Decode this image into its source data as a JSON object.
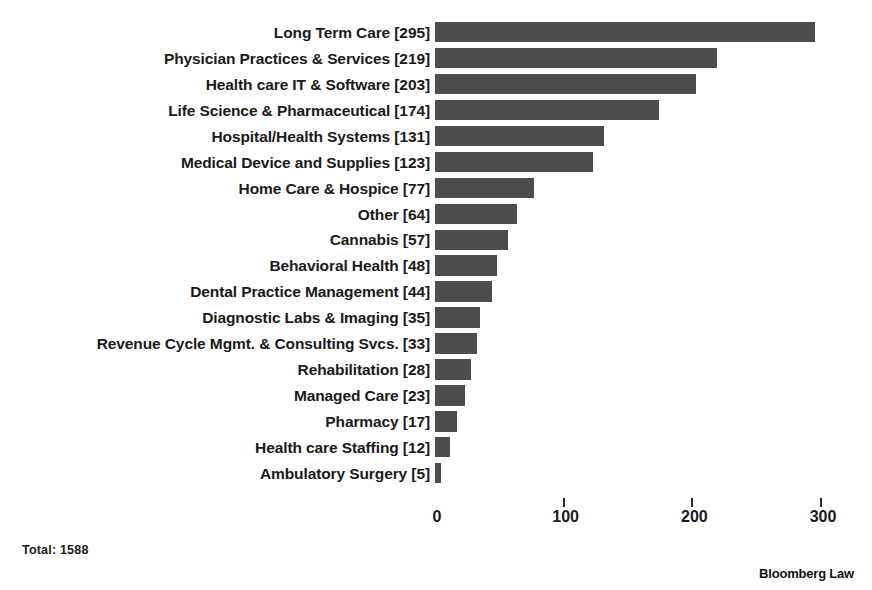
{
  "chart_data": {
    "type": "bar",
    "orientation": "horizontal",
    "title": "",
    "subtitle": "",
    "xlabel": "",
    "ylabel": "",
    "xlim": [
      0,
      320
    ],
    "xticks": [
      0,
      100,
      200,
      300
    ],
    "xtick_labels": [
      "0",
      "100",
      "200",
      "300"
    ],
    "tick_marks_shown_at": [
      100,
      200,
      300
    ],
    "grid": false,
    "legend": null,
    "bar_color": "#4d4d4d",
    "background_color": "#ffffff",
    "categories": [
      "Long Term Care",
      "Physician Practices & Services",
      "Health care IT & Software",
      "Life Science & Pharmaceutical",
      "Hospital/Health Systems",
      "Medical Device and Supplies",
      "Home Care & Hospice",
      "Other",
      "Cannabis",
      "Behavioral Health",
      "Dental Practice Management",
      "Diagnostic Labs & Imaging",
      "Revenue Cycle Mgmt. & Consulting Svcs.",
      "Rehabilitation",
      "Managed Care",
      "Pharmacy",
      "Health care Staffing",
      "Ambulatory Surgery"
    ],
    "values": [
      295,
      219,
      203,
      174,
      131,
      123,
      77,
      64,
      57,
      48,
      44,
      35,
      33,
      28,
      23,
      17,
      12,
      5
    ],
    "tick_labels": [
      "Long Term Care [295]",
      "Physician Practices & Services [219]",
      "Health care IT & Software [203]",
      "Life Science & Pharmaceutical [174]",
      "Hospital/Health Systems [131]",
      "Medical Device and Supplies [123]",
      "Home Care & Hospice [77]",
      "Other [64]",
      "Cannabis [57]",
      "Behavioral Health [48]",
      "Dental Practice Management [44]",
      "Diagnostic Labs & Imaging [35]",
      "Revenue Cycle Mgmt. & Consulting Svcs. [33]",
      "Rehabilitation [28]",
      "Managed Care [23]",
      "Pharmacy [17]",
      "Health care Staffing [12]",
      "Ambulatory Surgery [5]"
    ]
  },
  "footer": {
    "total_note": "Total: 1588",
    "brand": "Bloomberg Law"
  }
}
